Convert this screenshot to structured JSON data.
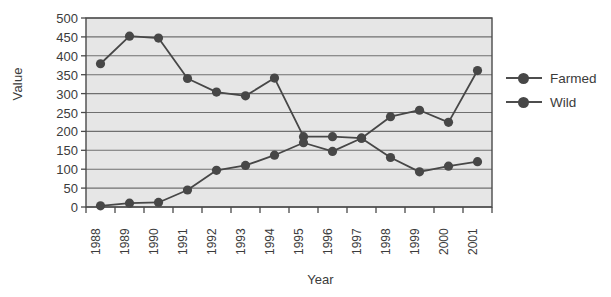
{
  "chart_data": {
    "type": "line",
    "title": "",
    "xlabel": "Year",
    "ylabel": "Value",
    "categories": [
      "1988",
      "1989",
      "1990",
      "1991",
      "1992",
      "1993",
      "1994",
      "1995",
      "1996",
      "1997",
      "1998",
      "1999",
      "2000",
      "2001"
    ],
    "ylim": [
      0,
      500
    ],
    "ytick_step": 50,
    "yticks": [
      "500",
      "450",
      "400",
      "350",
      "300",
      "250",
      "200",
      "150",
      "100",
      "50",
      "0"
    ],
    "grid": true,
    "legend_position": "right",
    "series": [
      {
        "name": "Farmed",
        "color": "#474747",
        "values": [
          3,
          10,
          12,
          45,
          97,
          110,
          137,
          170,
          147,
          182,
          239,
          256,
          224,
          361
        ]
      },
      {
        "name": "Wild",
        "color": "#474747",
        "values": [
          379,
          452,
          447,
          340,
          304,
          294,
          341,
          186,
          186,
          182,
          131,
          93,
          108,
          120
        ]
      }
    ],
    "plot_bg": "#e6e6e6",
    "grid_color": "#6f6f6f",
    "axis_color": "#4a4a4a"
  },
  "legend": {
    "items": [
      {
        "label": "Farmed"
      },
      {
        "label": "Wild"
      }
    ]
  }
}
